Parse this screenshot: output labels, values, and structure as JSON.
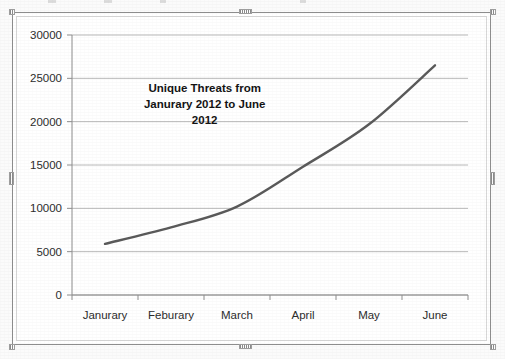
{
  "chart_data": {
    "type": "line",
    "title_lines": [
      "Unique Threats from",
      "Janurary 2012 to June",
      "2012"
    ],
    "categories": [
      "Janurary",
      "Feburary",
      "March",
      "April",
      "May",
      "June"
    ],
    "values": [
      5900,
      7800,
      10200,
      14800,
      19700,
      26500
    ],
    "series": [
      {
        "name": "Unique Threats",
        "values": [
          5900,
          7800,
          10200,
          14800,
          19700,
          26500
        ]
      }
    ],
    "xlabel": "",
    "ylabel": "",
    "ylim": [
      0,
      30000
    ],
    "ytick_values": [
      0,
      5000,
      10000,
      15000,
      20000,
      25000,
      30000
    ],
    "ytick_labels": [
      "0",
      "5000",
      "10000",
      "15000",
      "20000",
      "25000",
      "30000"
    ],
    "grid": "horizontal",
    "legend": "none",
    "line_color": "#595959",
    "gridline_color": "#b8b8b8",
    "axis_color": "#8d8d8d",
    "plot_background": "#ffffff"
  },
  "frame": {
    "border_color": "#8d8d8d",
    "inner_border_color": "#d7d7d7",
    "handle_color": "#8a8a8a"
  },
  "page": {
    "background": "#fbfbfb"
  }
}
